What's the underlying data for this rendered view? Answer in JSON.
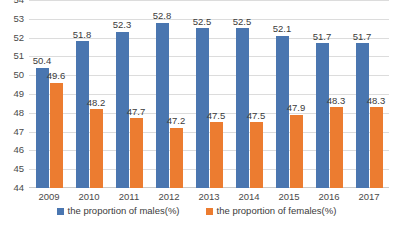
{
  "chart_data": {
    "type": "bar",
    "title": "",
    "subtitle": "",
    "xlabel": "",
    "ylabel": "",
    "categories": [
      "2009",
      "2010",
      "2011",
      "2012",
      "2013",
      "2014",
      "2015",
      "2016",
      "2017"
    ],
    "series": [
      {
        "name": "the proportion of males(%)",
        "color": "#4a76b0",
        "values": [
          50.4,
          51.8,
          52.3,
          52.8,
          52.5,
          52.5,
          52.1,
          51.7,
          51.7
        ]
      },
      {
        "name": "the proportion of females(%)",
        "color": "#ec7c30",
        "values": [
          49.6,
          48.2,
          47.7,
          47.2,
          47.5,
          47.5,
          47.9,
          48.3,
          48.3
        ]
      }
    ],
    "ylim": [
      44,
      54
    ],
    "ytick_step": 1,
    "ytick_labels": [
      "54",
      "53",
      "52",
      "51",
      "50",
      "49",
      "48",
      "47",
      "46",
      "45",
      "44"
    ],
    "grid": true,
    "data_labels": true,
    "legend_position": "bottom"
  },
  "legend": {
    "items": [
      {
        "label": "the proportion of males(%)"
      },
      {
        "label": "the proportion of females(%)"
      }
    ]
  },
  "colors": {
    "males": "#4a76b0",
    "females": "#ec7c30",
    "gridline": "#dcdcdc",
    "axis": "#c9c9c9",
    "text": "#3b3b3b",
    "background": "#ffffff"
  }
}
